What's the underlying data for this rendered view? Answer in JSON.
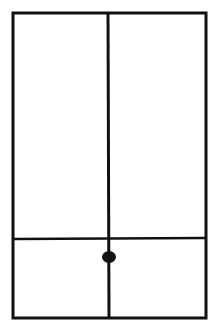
{
  "diagram": {
    "stroke_color": "#111111",
    "background_color": "#ffffff",
    "outer_rect": {
      "x": 13,
      "y": 13,
      "width": 193,
      "height": 305
    },
    "vertical_line": {
      "x": 108,
      "y1": 13,
      "y2": 318
    },
    "horizontal_line": {
      "y": 238,
      "x1": 13,
      "x2": 206
    },
    "dot": {
      "cx": 108,
      "cy": 257,
      "r": 6
    }
  }
}
